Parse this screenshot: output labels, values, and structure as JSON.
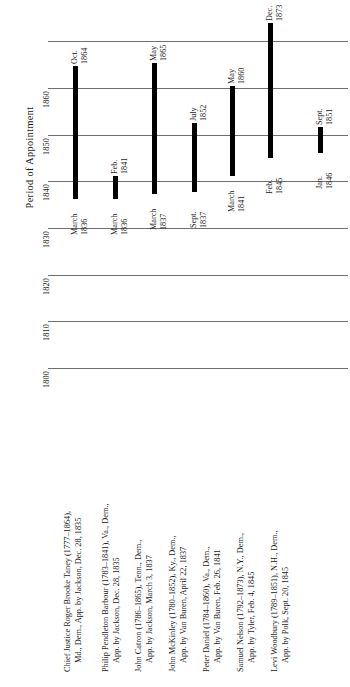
{
  "chart_data": {
    "type": "bar",
    "orientation": "vertical-timeline",
    "title": "Period of Appointment",
    "ylabel": "Period of Appointment",
    "xlabel": "",
    "ylim": [
      1795,
      1875
    ],
    "grid": true,
    "legend_position": "below",
    "tick_labels": [
      "1800",
      "1810",
      "1820",
      "1830",
      "1840",
      "1850",
      "1860"
    ],
    "tick_values": [
      1800,
      1810,
      1820,
      1830,
      1840,
      1850,
      1860
    ],
    "categories": [
      "Chief Justice Roger Brooke Taney",
      "Philip Pendleton Barbour",
      "John Catron",
      "John McKinley",
      "Peter Daniel",
      "Samuel Nelson",
      "Levi Woodbury"
    ],
    "bars": [
      {
        "name": "Chief Justice Roger Brooke Taney",
        "start_label": "March\n1836",
        "start_month": "March",
        "start_year": "1836",
        "end_label": "Oct.\n1864",
        "end_month": "Oct.",
        "end_year": "1864",
        "start_value": 1836.2,
        "end_value": 1864.8
      },
      {
        "name": "Philip Pendleton Barbour",
        "start_label": "March\n1836",
        "start_month": "March",
        "start_year": "1836",
        "end_label": "Feb.\n1841",
        "end_month": "Feb.",
        "end_year": "1841",
        "start_value": 1836.2,
        "end_value": 1841.1
      },
      {
        "name": "John Catron",
        "start_label": "March\n1837",
        "start_month": "March",
        "start_year": "1837",
        "end_label": "May\n1865",
        "end_month": "May",
        "end_year": "1865",
        "start_value": 1837.2,
        "end_value": 1865.4
      },
      {
        "name": "John McKinley",
        "start_label": "Sept.\n1837",
        "start_month": "Sept.",
        "start_year": "1837",
        "end_label": "July\n1852",
        "end_month": "July",
        "end_year": "1852",
        "start_value": 1837.7,
        "end_value": 1852.5
      },
      {
        "name": "Peter Daniel",
        "start_label": "March\n1841",
        "start_month": "March",
        "start_year": "1841",
        "end_label": "May\n1860",
        "end_month": "May",
        "end_year": "1860",
        "start_value": 1841.2,
        "end_value": 1860.4
      },
      {
        "name": "Samuel Nelson",
        "start_label": "Feb.\n1845",
        "start_month": "Feb.",
        "start_year": "1845",
        "end_label": "Dec.\n1873",
        "end_month": "Dec.",
        "end_year": "1873",
        "start_value": 1845.1,
        "end_value": 1873.9
      },
      {
        "name": "Levi Woodbury",
        "start_label": "Jan.\n1846",
        "start_month": "Jan.",
        "start_year": "1846",
        "end_label": "Sept.\n1851",
        "end_month": "Sept.",
        "end_year": "1851",
        "start_value": 1846.0,
        "end_value": 1851.7
      }
    ]
  },
  "axis": {
    "title": "Period of Appointment",
    "ticks": [
      {
        "label": "1860"
      },
      {
        "label": "1850"
      },
      {
        "label": "1840"
      },
      {
        "label": "1830"
      },
      {
        "label": "1820"
      },
      {
        "label": "1810"
      },
      {
        "label": "1800"
      }
    ]
  },
  "bar_labels": {
    "taney_end_month": "Oct.",
    "taney_end_year": "1864",
    "taney_start_month": "March",
    "taney_start_year": "1836",
    "barbour_start_month": "March",
    "barbour_start_year": "1836",
    "barbour_end_month": "Feb.",
    "barbour_end_year": "1841",
    "catron_end_month": "May",
    "catron_end_year": "1865",
    "catron_start_month": "March",
    "catron_start_year": "1837",
    "mckinley_end_month": "July",
    "mckinley_end_year": "1852",
    "mckinley_start_month": "Sept.",
    "mckinley_start_year": "1837",
    "daniel_end_month": "May",
    "daniel_end_year": "1860",
    "daniel_start_month": "March",
    "daniel_start_year": "1841",
    "nelson_end_month": "Dec.",
    "nelson_end_year": "1873",
    "nelson_start_month": "Feb.",
    "nelson_start_year": "1845",
    "woodbury_start_month": "Jan.",
    "woodbury_start_year": "1846",
    "woodbury_end_month": "Sept.",
    "woodbury_end_year": "1851"
  },
  "legend": {
    "items": [
      {
        "line1": "Chief Justice Roger Brooke Taney (1777–1864),",
        "line2": "Md., Dem., App. by Jackson, Dec. 28, 1835"
      },
      {
        "line1": "Philip Pendleton Barbour (1783–1841), Va., Dem.,",
        "line2": "App. by Jackson, Dec. 28, 1835"
      },
      {
        "line1": "John Catron (1786–1865), Tenn., Dem.,",
        "line2": "App. by Jackson, March 3, 1837"
      },
      {
        "line1": "John McKinley (1780–1852), Ky., Dem.,",
        "line2": "App. by Van Buren, April 22, 1837"
      },
      {
        "line1": "Peter Daniel (1784–1860), Va., Dem.,",
        "line2": "App. by Van Buren, Feb. 26, 1841"
      },
      {
        "line1": "Samuel Nelson (1792–1873), N.Y., Dem.,",
        "line2": "App. by Tyler, Feb. 4, 1845"
      },
      {
        "line1": "Levi Woodbury (1789–1851), N.H., Dem.,",
        "line2": "App. by Polk, Sept. 20, 1845"
      }
    ]
  },
  "colors": {
    "bar": "#000000",
    "grid": "#6f6f6f",
    "text": "#1a1a1a",
    "background": "#ffffff"
  }
}
